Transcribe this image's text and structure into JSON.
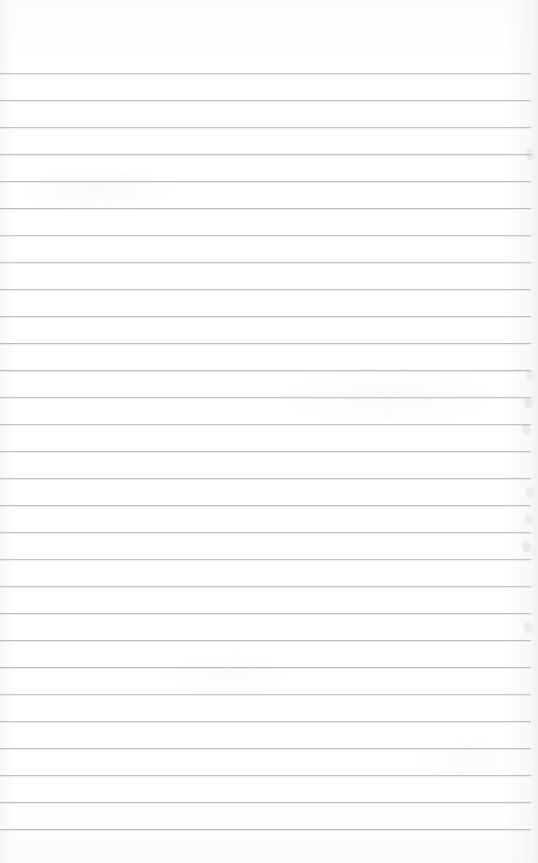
{
  "document": {
    "kind": "scanned-blank-ruled-page",
    "title": "Blank ruled notebook page",
    "content_text": "",
    "page_width": 538,
    "page_height": 863,
    "background_color": "#fefefe",
    "has_handwriting": false,
    "has_printed_text": false
  },
  "ruling": {
    "label": "horizontal ruled lines",
    "line_color": "#b9bbc0",
    "line_thickness_px": 1,
    "line_spacing_px": 27,
    "first_line_y": 73,
    "last_line_y": 844,
    "line_count": 29,
    "left_inset_px": 0,
    "right_end_px": 531,
    "top_margin_px": 73,
    "bottom_margin_px": 19,
    "line_positions": [
      73,
      100,
      127,
      154,
      181,
      208,
      235,
      262,
      289,
      316,
      343,
      370,
      397,
      424,
      451,
      478,
      505,
      532,
      559,
      586,
      613,
      640,
      667,
      694,
      721,
      748,
      775,
      802,
      829
    ]
  },
  "artifacts": {
    "label": "scan artifacts",
    "edge_shadow_color": "#f0f0f3",
    "smudge_color": "#b0b2ba",
    "smudge_positions_y": [
      376,
      403,
      430,
      493,
      520,
      547,
      155,
      628
    ]
  }
}
